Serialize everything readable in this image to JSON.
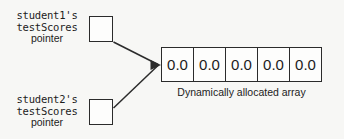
{
  "diagram": {
    "pointers": [
      {
        "id": "student1-pointer",
        "name_line_1": "student1's",
        "name_line_2": "testScores",
        "name_line_3": "pointer",
        "box_value": ""
      },
      {
        "id": "student2-pointer",
        "name_line_1": "student2's",
        "name_line_2": "testScores",
        "name_line_3": "pointer",
        "box_value": ""
      }
    ],
    "array": {
      "caption": "Dynamically allocated array",
      "cells": [
        "0.0",
        "0.0",
        "0.0",
        "0.0",
        "0.0"
      ]
    },
    "colors": {
      "background": "#f7f7f5",
      "stroke": "#2b2b2b",
      "text": "#1c1c1c",
      "cell_fill": "#fdfdfc"
    }
  }
}
